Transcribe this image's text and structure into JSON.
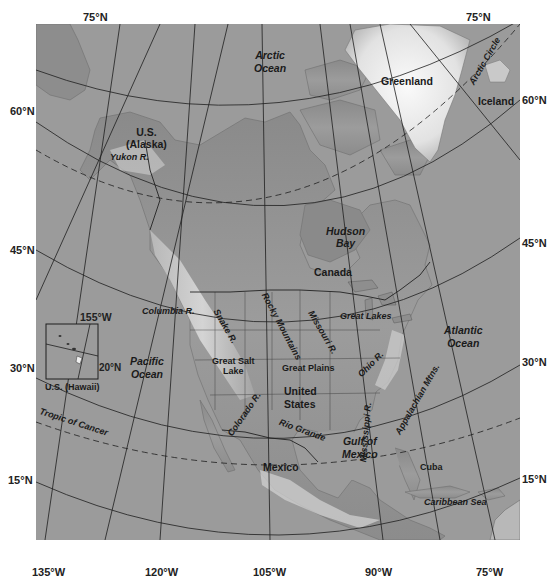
{
  "map": {
    "title": "North America physical map",
    "colors": {
      "ocean": "#9a9a9a",
      "land_low": "#7a7a7a",
      "land_high": "#d8d8d8",
      "ice": "#f2f2f2",
      "grid": "#1e1e1e",
      "frame": "#ffffff"
    },
    "latitude_labels_left": [
      "75°N",
      "60°N",
      "45°N",
      "30°N",
      "15°N"
    ],
    "latitude_labels_right": [
      "75°N",
      "60°N",
      "45°N",
      "30°N",
      "15°N"
    ],
    "longitude_labels_bottom": [
      "135°W",
      "120°W",
      "105°W",
      "90°W",
      "75°W"
    ],
    "special_lines": [
      "Arctic Circle",
      "Tropic of Cancer"
    ],
    "oceans": [
      "Arctic Ocean",
      "Pacific Ocean",
      "Atlantic Ocean",
      "Gulf of Mexico",
      "Caribbean Sea"
    ],
    "water_bodies": [
      "Hudson Bay",
      "Great Lakes",
      "Great Salt Lake"
    ],
    "countries": [
      "Canada",
      "United States",
      "Mexico",
      "Cuba",
      "Greenland",
      "Iceland"
    ],
    "regions": [
      "U.S. (Alaska)",
      "U.S. (Hawaii)",
      "Great Plains"
    ],
    "mountains": [
      "Rocky Mountains",
      "Appalachian Mtns."
    ],
    "rivers": [
      "Yukon R.",
      "Columbia R.",
      "Snake R.",
      "Colorado R.",
      "Missouri R.",
      "Mississippi R.",
      "Ohio R.",
      "Rio Grande"
    ],
    "inset": {
      "title": "U.S. (Hawaii)",
      "lon_label": "155°W",
      "lat_label": "20°N"
    }
  },
  "labels": {
    "lat_left_75": "75°N",
    "lat_left_60": "60°N",
    "lat_left_45": "45°N",
    "lat_left_30": "30°N",
    "lat_left_15": "15°N",
    "lat_right_75": "75°N",
    "lat_right_60": "60°N",
    "lat_right_45": "45°N",
    "lat_right_30": "30°N",
    "lat_right_15": "15°N",
    "lon_135": "135°W",
    "lon_120": "120°W",
    "lon_105": "105°W",
    "lon_90": "90°W",
    "lon_75": "75°W",
    "arctic_ocean_1": "Arctic",
    "arctic_ocean_2": "Ocean",
    "greenland": "Greenland",
    "iceland": "Iceland",
    "arctic_circle": "Arctic Circle",
    "alaska_1": "U.S.",
    "alaska_2": "(Alaska)",
    "yukon": "Yukon R.",
    "hudson_1": "Hudson",
    "hudson_2": "Bay",
    "canada": "Canada",
    "columbia": "Columbia R.",
    "snake": "Snake R.",
    "rocky": "Rocky Mountains",
    "gsl_1": "Great Salt",
    "gsl_2": "Lake",
    "colorado": "Colorado R.",
    "missouri": "Missouri R.",
    "great_plains": "Great Plains",
    "great_lakes": "Great Lakes",
    "ohio": "Ohio R.",
    "appalachian": "Appalachian Mtns.",
    "mississippi": "Mississippi R.",
    "us_1": "United",
    "us_2": "States",
    "pacific_1": "Pacific",
    "pacific_2": "Ocean",
    "atlantic_1": "Atlantic",
    "atlantic_2": "Ocean",
    "rio_grande": "Rio Grande",
    "gulf_1": "Gulf of",
    "gulf_2": "Mexico",
    "mexico": "Mexico",
    "cuba": "Cuba",
    "caribbean": "Caribbean Sea",
    "tropic": "Tropic of Cancer",
    "hawaii_lon": "155°W",
    "hawaii_lat": "20°N",
    "hawaii_title": "U.S. (Hawaii)"
  }
}
